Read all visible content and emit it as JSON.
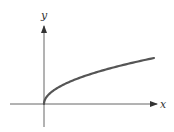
{
  "chart_data": {
    "type": "line",
    "title": "",
    "xlabel": "x",
    "ylabel": "y",
    "function": "y = sqrt(x)",
    "series": [
      {
        "name": "y = sqrt(x)",
        "x": [
          0,
          0.25,
          1,
          2,
          4,
          6,
          9,
          12
        ],
        "values": [
          0,
          0.5,
          1,
          1.414,
          2,
          2.449,
          3,
          3.464
        ]
      }
    ],
    "xlim": [
      -3,
      13
    ],
    "ylim": [
      -2,
      7
    ],
    "grid": false,
    "legend": false,
    "ticks": false
  },
  "axes": {
    "x_label": "x",
    "y_label": "y"
  },
  "colors": {
    "axis": "#333333",
    "curve": "#555555",
    "background": "#ffffff"
  }
}
